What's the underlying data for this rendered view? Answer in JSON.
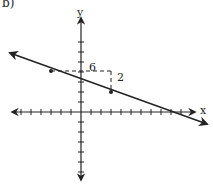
{
  "part_label": "b)",
  "axes": {
    "x_label": "x",
    "y_label": "y",
    "x_ticks_range": [
      -7,
      10
    ],
    "y_ticks_range": [
      -7,
      7
    ],
    "tick_spacing_px": 10,
    "origin_px": [
      81,
      112
    ]
  },
  "line": {
    "slope": "-1/3",
    "y_intercept": 3,
    "points": [
      [
        -3,
        4
      ],
      [
        3,
        2
      ]
    ]
  },
  "slope_triangle": {
    "run_label": "6",
    "rise_label": "2"
  },
  "colors": {
    "ink": "#222222",
    "background": "#ffffff"
  }
}
